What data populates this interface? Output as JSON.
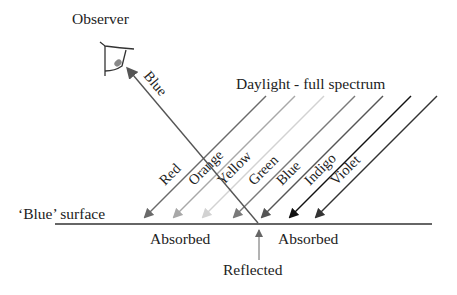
{
  "title": "Daylight - full spectrum",
  "observer_label": "Observer",
  "surface_label": "‘Blue’ surface",
  "absorbed_left": "Absorbed",
  "absorbed_right": "Absorbed",
  "reflected_label": "Reflected",
  "reflected_ray": {
    "label": "Blue",
    "color": "#555555"
  },
  "incoming_rays": [
    {
      "label": "Red",
      "color": "#6a6a6a"
    },
    {
      "label": "Orange",
      "color": "#a8a8a8"
    },
    {
      "label": "Yellow",
      "color": "#d2d2d2"
    },
    {
      "label": "Green",
      "color": "#7a7a7a"
    },
    {
      "label": "Blue",
      "color": "#555555"
    },
    {
      "label": "Indigo",
      "color": "#111111"
    },
    {
      "label": "Violet",
      "color": "#333333"
    }
  ],
  "surface_color": "#666666"
}
